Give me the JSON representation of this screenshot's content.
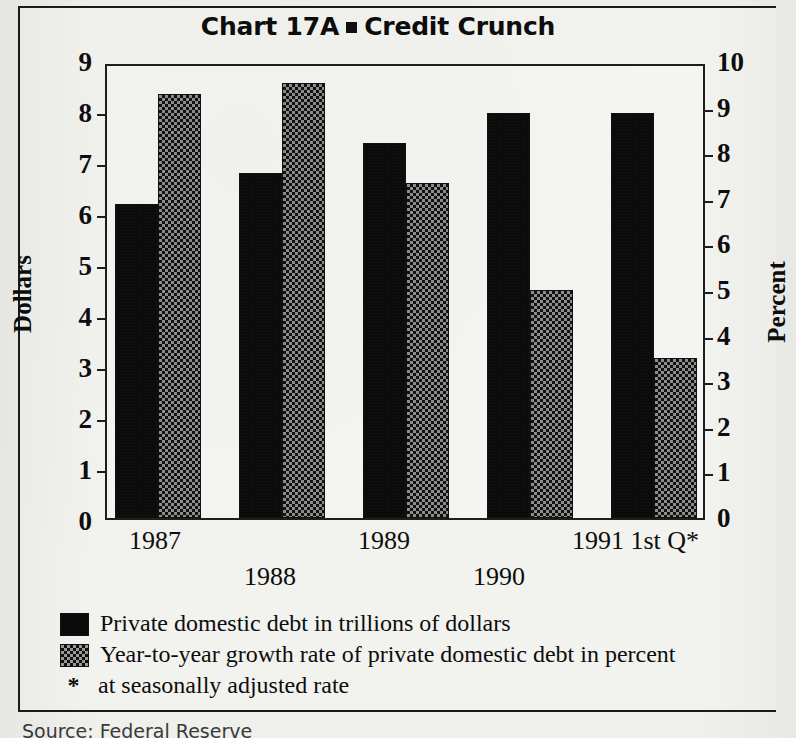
{
  "chart_data": {
    "type": "bar",
    "title_prefix": "Chart 17A",
    "title_suffix": "Credit Crunch",
    "title_marker": "square-bullet",
    "categories": [
      "1987",
      "1988",
      "1989",
      "1990",
      "1991 1st Q*"
    ],
    "series": [
      {
        "name": "Private domestic debt in trillions of dollars",
        "axis": "left",
        "unit": "trillions of dollars",
        "pattern": "solid-black",
        "values": [
          6.2,
          6.8,
          7.4,
          8.0,
          8.0
        ]
      },
      {
        "name": "Year-to-year growth rate of private domestic debt in percent",
        "axis": "right",
        "unit": "percent",
        "pattern": "checkered-gray",
        "values": [
          9.3,
          9.55,
          7.35,
          5.0,
          3.5
        ]
      }
    ],
    "xlabel": "",
    "ylabel_left": "Dollars",
    "ylabel_right": "Percent",
    "ylim_left": [
      0,
      9
    ],
    "ylim_right": [
      0,
      10
    ],
    "yticks_left": [
      "0",
      "1",
      "2",
      "3",
      "4",
      "5",
      "6",
      "7",
      "8",
      "9"
    ],
    "yticks_right": [
      "0",
      "1",
      "2",
      "3",
      "4",
      "5",
      "6",
      "7",
      "8",
      "9",
      "10"
    ],
    "grid": false,
    "legend_position": "below"
  },
  "axes": {
    "left_title": "Dollars",
    "right_title": "Percent",
    "left_ticks": [
      "9",
      "8",
      "7",
      "6",
      "5",
      "4",
      "3",
      "2",
      "1",
      "0"
    ],
    "right_ticks": [
      "10",
      "9",
      "8",
      "7",
      "6",
      "5",
      "4",
      "3",
      "2",
      "1",
      "0"
    ]
  },
  "xlabels": [
    {
      "text": "1987",
      "row": "top"
    },
    {
      "text": "1988",
      "row": "bottom"
    },
    {
      "text": "1989",
      "row": "top"
    },
    {
      "text": "1990",
      "row": "bottom"
    },
    {
      "text": "1991 1st Q*",
      "row": "top"
    }
  ],
  "legend": {
    "items": [
      {
        "swatch": "solid",
        "label": "Private domestic debt in trillions of dollars"
      },
      {
        "swatch": "checker",
        "label": "Year-to-year growth rate of private domestic debt in percent"
      }
    ],
    "footnote_marker": "*",
    "footnote": "at seasonally adjusted rate"
  },
  "source": {
    "text": "Source: Federal Reserve"
  }
}
